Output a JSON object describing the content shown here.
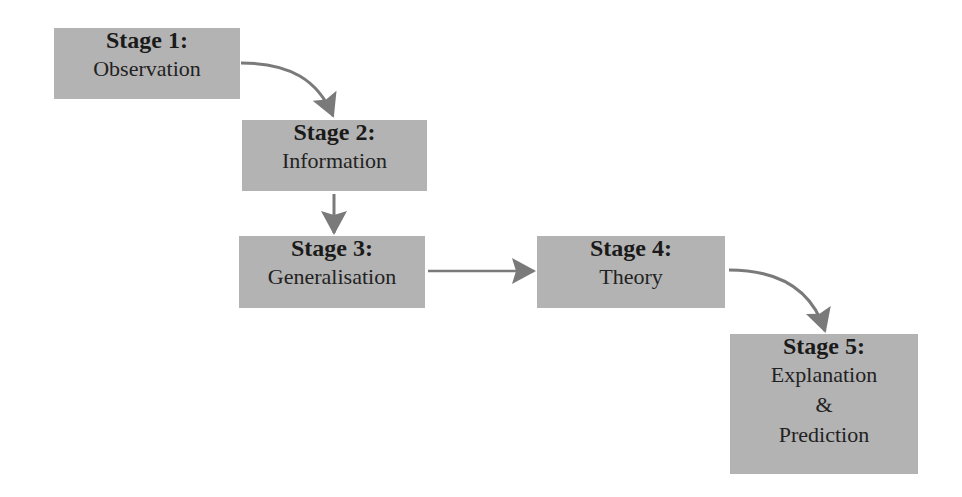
{
  "diagram": {
    "type": "flowchart",
    "colors": {
      "box_fill": "#b3b3b3",
      "arrow": "#7a7a7a",
      "text": "#1a1a1a",
      "background": "#ffffff"
    },
    "stages": [
      {
        "id": "stage1",
        "title": "Stage 1:",
        "lines": [
          "Observation"
        ]
      },
      {
        "id": "stage2",
        "title": "Stage 2:",
        "lines": [
          "Information"
        ]
      },
      {
        "id": "stage3",
        "title": "Stage 3:",
        "lines": [
          "Generalisation"
        ]
      },
      {
        "id": "stage4",
        "title": "Stage 4:",
        "lines": [
          "Theory"
        ]
      },
      {
        "id": "stage5",
        "title": "Stage 5:",
        "lines": [
          "Explanation",
          "&",
          "Prediction"
        ]
      }
    ],
    "edges": [
      {
        "from": "stage1",
        "to": "stage2",
        "style": "curved"
      },
      {
        "from": "stage2",
        "to": "stage3",
        "style": "straight"
      },
      {
        "from": "stage3",
        "to": "stage4",
        "style": "straight"
      },
      {
        "from": "stage4",
        "to": "stage5",
        "style": "curved"
      }
    ]
  }
}
